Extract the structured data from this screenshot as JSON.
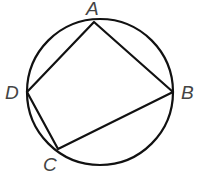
{
  "diagram": {
    "type": "cyclic-quadrilateral",
    "circle": {
      "cx": 100,
      "cy": 92,
      "r": 73
    },
    "points": {
      "A": {
        "label": "A",
        "x": 94,
        "y": 22
      },
      "B": {
        "label": "B",
        "x": 173,
        "y": 92
      },
      "C": {
        "label": "C",
        "x": 58,
        "y": 149
      },
      "D": {
        "label": "D",
        "x": 27,
        "y": 92
      }
    },
    "edges": [
      "AB",
      "BC",
      "CD",
      "DA"
    ],
    "stroke_color": "#111111",
    "label_color": "#444444"
  }
}
